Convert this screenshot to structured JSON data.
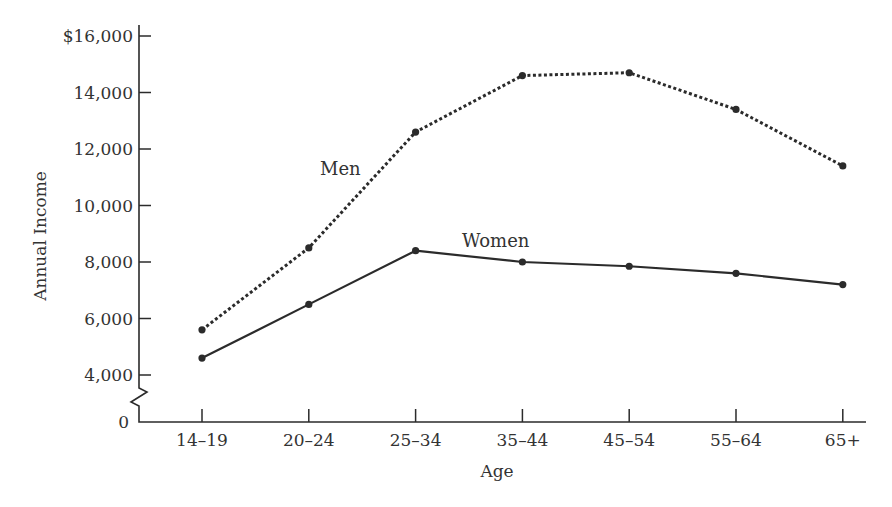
{
  "chart_data": {
    "type": "line",
    "title": "",
    "xlabel": "Age",
    "ylabel": "Annual Income",
    "categories": [
      "14–19",
      "20–24",
      "25–34",
      "35–44",
      "45–54",
      "55–64",
      "65+"
    ],
    "series": [
      {
        "name": "Men",
        "style": "dotted",
        "values": [
          5600,
          8500,
          12600,
          14600,
          14700,
          13400,
          11400
        ]
      },
      {
        "name": "Women",
        "style": "solid",
        "values": [
          4600,
          6500,
          8400,
          8000,
          7850,
          7600,
          7200
        ]
      }
    ],
    "yticks": [
      {
        "value": 16000,
        "label": "$16,000"
      },
      {
        "value": 14000,
        "label": "14,000"
      },
      {
        "value": 12000,
        "label": "12,000"
      },
      {
        "value": 10000,
        "label": "10,000"
      },
      {
        "value": 8000,
        "label": "8,000"
      },
      {
        "value": 6000,
        "label": "6,000"
      },
      {
        "value": 4000,
        "label": "4,000"
      }
    ],
    "y_zero_label": "0",
    "axis_break": true,
    "ylim": [
      0,
      16000
    ],
    "grid": false,
    "legend": "inline labels",
    "colors": {
      "line": "#2b2b2b",
      "text": "#333333"
    }
  }
}
